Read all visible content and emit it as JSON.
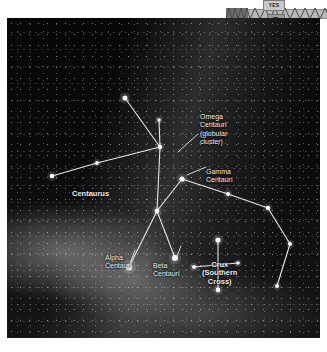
{
  "top_widget": {
    "tag_label": "YES",
    "rail_name": "zigzag-rail",
    "pendant_name": "hanging-lamp"
  },
  "sky_map": {
    "title": "Centaurus and Crux star chart",
    "background_color": "#07070a",
    "star_color": "#ffffff",
    "line_color": "#e8e8e8",
    "label_color": "#f2f2f2",
    "labels": [
      {
        "id": "omega-centauri",
        "text": "Omega\nCentauri\n(globular\ncluster)",
        "bold": false,
        "x": 193,
        "y": 95
      },
      {
        "id": "gamma-centauri",
        "text": "Gamma\nCentauri",
        "bold": false,
        "x": 199,
        "y": 150
      },
      {
        "id": "centaurus",
        "text": "Centaurus",
        "bold": true,
        "x": 65,
        "y": 172
      },
      {
        "id": "alpha-centauri",
        "text": "Alpha\nCentauri",
        "bold": false,
        "x": 98,
        "y": 236
      },
      {
        "id": "beta-centauri",
        "text": "Beta\nCentauri",
        "bold": false,
        "x": 146,
        "y": 244
      },
      {
        "id": "crux-southern-cross",
        "text": "Crux\n(Southern\nCross)",
        "bold": true,
        "x": 195,
        "y": 243
      }
    ],
    "stars": [
      {
        "id": "star-n1",
        "x": 118,
        "y": 80,
        "r": 2.6
      },
      {
        "id": "star-n2",
        "x": 152,
        "y": 102,
        "r": 1.8
      },
      {
        "id": "star-hub",
        "x": 153,
        "y": 129,
        "r": 2.2
      },
      {
        "id": "star-w1",
        "x": 90,
        "y": 145,
        "r": 1.9
      },
      {
        "id": "star-w2",
        "x": 45,
        "y": 158,
        "r": 2.3
      },
      {
        "id": "star-gamma",
        "x": 175,
        "y": 161,
        "r": 2.6
      },
      {
        "id": "star-mid",
        "x": 150,
        "y": 193,
        "r": 2.4
      },
      {
        "id": "star-alpha",
        "x": 122,
        "y": 249,
        "r": 3.4
      },
      {
        "id": "star-beta",
        "x": 168,
        "y": 240,
        "r": 3.0
      },
      {
        "id": "star-e1",
        "x": 221,
        "y": 176,
        "r": 2.1
      },
      {
        "id": "star-e2",
        "x": 261,
        "y": 190,
        "r": 2.2
      },
      {
        "id": "star-e3",
        "x": 283,
        "y": 226,
        "r": 2.0
      },
      {
        "id": "star-e4",
        "x": 270,
        "y": 268,
        "r": 2.0
      },
      {
        "id": "star-crux-top",
        "x": 211,
        "y": 222,
        "r": 2.6
      },
      {
        "id": "star-crux-bottom",
        "x": 211,
        "y": 272,
        "r": 2.4
      },
      {
        "id": "star-crux-left",
        "x": 187,
        "y": 249,
        "r": 2.0
      },
      {
        "id": "star-crux-right",
        "x": 231,
        "y": 245,
        "r": 1.8
      }
    ],
    "constellation_lines": [
      {
        "id": "line-n1-hub",
        "from": "star-n1",
        "to": "star-hub"
      },
      {
        "id": "line-n2-hub",
        "from": "star-n2",
        "to": "star-hub"
      },
      {
        "id": "line-hub-w1",
        "from": "star-hub",
        "to": "star-w1"
      },
      {
        "id": "line-w1-w2",
        "from": "star-w1",
        "to": "star-w2"
      },
      {
        "id": "line-hub-mid",
        "from": "star-hub",
        "to": "star-mid"
      },
      {
        "id": "line-gamma-mid",
        "from": "star-gamma",
        "to": "star-mid"
      },
      {
        "id": "line-mid-alpha",
        "from": "star-mid",
        "to": "star-alpha"
      },
      {
        "id": "line-mid-beta",
        "from": "star-mid",
        "to": "star-beta"
      },
      {
        "id": "line-gamma-e1",
        "from": "star-gamma",
        "to": "star-e1"
      },
      {
        "id": "line-e1-e2",
        "from": "star-e1",
        "to": "star-e2"
      },
      {
        "id": "line-e2-e3",
        "from": "star-e2",
        "to": "star-e3"
      },
      {
        "id": "line-e3-e4",
        "from": "star-e3",
        "to": "star-e4"
      },
      {
        "id": "line-crux-vert",
        "from": "star-crux-top",
        "to": "star-crux-bottom"
      },
      {
        "id": "line-crux-horiz",
        "from": "star-crux-left",
        "to": "star-crux-right"
      }
    ],
    "leader_lines": [
      {
        "id": "leader-omega",
        "x1": 191,
        "y1": 116,
        "x2": 171,
        "y2": 134
      },
      {
        "id": "leader-gamma",
        "x1": 199,
        "y1": 149,
        "x2": 180,
        "y2": 157
      },
      {
        "id": "leader-alpha",
        "x1": 128,
        "y1": 232,
        "x2": 123,
        "y2": 246
      },
      {
        "id": "leader-beta",
        "x1": 174,
        "y1": 228,
        "x2": 170,
        "y2": 238
      }
    ]
  }
}
